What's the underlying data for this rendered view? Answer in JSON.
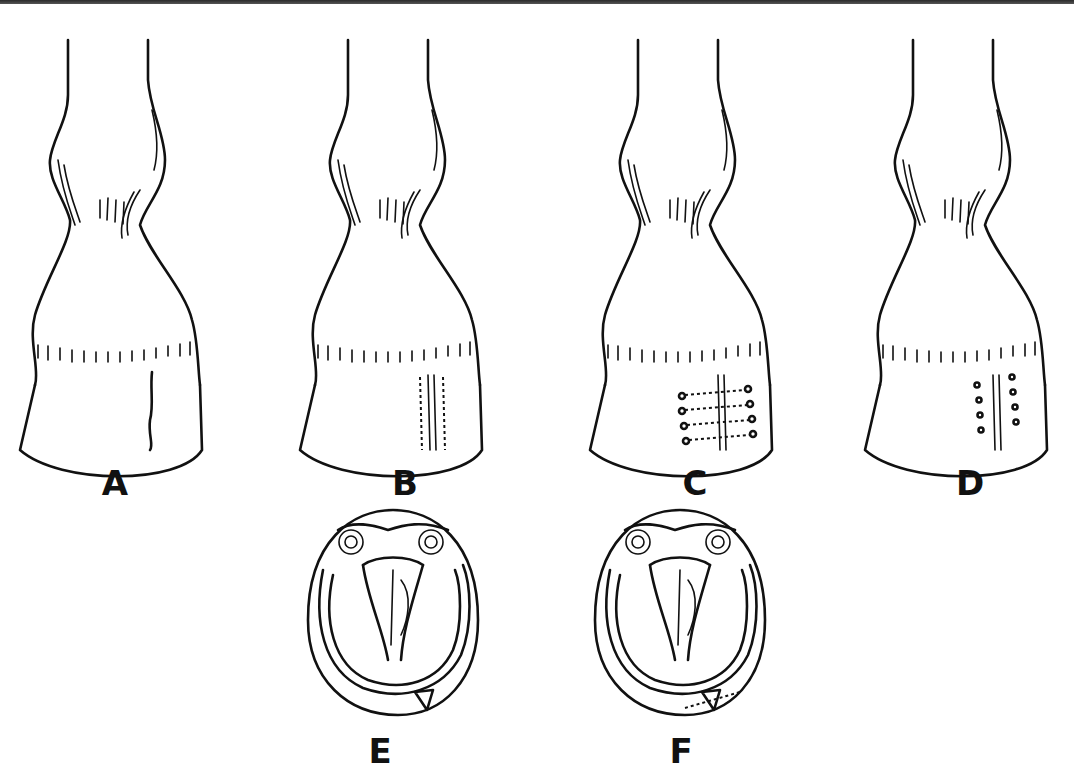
{
  "figure": {
    "panels": [
      {
        "id": "A",
        "label": "A",
        "view": "front",
        "detail": "vertical crack in hoof wall"
      },
      {
        "id": "B",
        "label": "B",
        "view": "front",
        "detail": "crack grooved with dotted margins"
      },
      {
        "id": "C",
        "label": "C",
        "view": "front",
        "detail": "crack laced across with sutures"
      },
      {
        "id": "D",
        "label": "D",
        "view": "front",
        "detail": "holes drilled either side of crack"
      },
      {
        "id": "E",
        "label": "E",
        "view": "sole",
        "detail": "solar view with crack at toe"
      },
      {
        "id": "F",
        "label": "F",
        "view": "sole",
        "detail": "solar view with crack stabilized"
      }
    ]
  }
}
